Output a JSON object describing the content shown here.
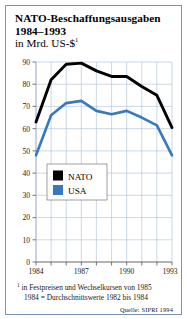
{
  "title": {
    "line1": "NATO-Beschaffungsausgaben",
    "line2": "1984–1993",
    "subtitle": "in Mrd. US-$",
    "subtitle_marker": "1"
  },
  "footnotes": {
    "marker": "1",
    "line1": "in Festpreisen und Wechselkursen von 1985",
    "line2": "1984 = Durchschnittswerte 1982 bis 1984",
    "source": "Quelle: SIPRI 1994"
  },
  "legend": {
    "position": "inside-lower-left",
    "entries": [
      {
        "label": "NATO",
        "color": "#000000"
      },
      {
        "label": "USA",
        "color": "#3778bf"
      }
    ]
  },
  "colors": {
    "nato": "#000000",
    "usa": "#3778bf",
    "grid": "#a8bdd6",
    "axis": "#555555",
    "frame": "#7d93b5",
    "background": "#ffffff"
  },
  "chart_data": {
    "type": "line",
    "title": "NATO-Beschaffungsausgaben 1984–1993",
    "subtitle": "in Mrd. US-$",
    "xlabel": "",
    "ylabel": "",
    "x": [
      1984,
      1985,
      1986,
      1987,
      1988,
      1989,
      1990,
      1991,
      1992,
      1993
    ],
    "xtick_labels": [
      "1984",
      "1987",
      "1990",
      "1993"
    ],
    "xtick_values": [
      1984,
      1987,
      1990,
      1993
    ],
    "xlim": [
      1984,
      1993
    ],
    "ytick_labels": [
      "0",
      "10",
      "20",
      "30",
      "40",
      "50",
      "60",
      "70",
      "80",
      "90"
    ],
    "ytick_values": [
      0,
      10,
      20,
      30,
      40,
      50,
      60,
      70,
      80,
      90
    ],
    "ylim": [
      0,
      90
    ],
    "grid": true,
    "legend_position": "inside lower left",
    "series": [
      {
        "name": "NATO",
        "color": "#000000",
        "values": [
          63,
          82,
          89,
          89.5,
          86,
          83.5,
          83.5,
          79,
          75,
          60.5
        ]
      },
      {
        "name": "USA",
        "color": "#3778bf",
        "values": [
          48,
          66,
          71.5,
          72.5,
          68,
          66.5,
          68,
          65,
          61.5,
          48
        ]
      }
    ]
  }
}
